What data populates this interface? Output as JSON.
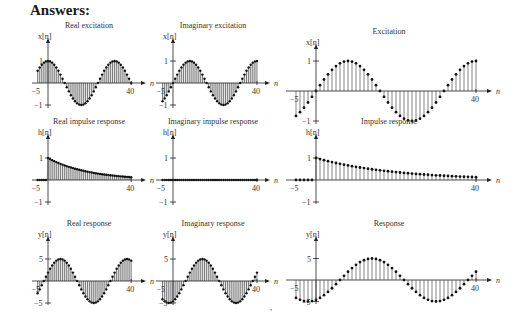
{
  "heading": "Answers:",
  "stray_mark": ",",
  "chart_data": [
    {
      "id": "real-excitation",
      "type": "stem",
      "title": "Real excitation",
      "ylabel": "x[n]",
      "xlabel": "n",
      "xticks": [
        "-5",
        "40"
      ],
      "yticks": [
        "1",
        "-1"
      ],
      "xrange": [
        -5,
        40
      ],
      "yrange": [
        -1,
        1
      ],
      "formula": "cos(2*pi*n/32)",
      "filled": true,
      "layout": {
        "x0": 48,
        "xs": 2.08,
        "y0": 83,
        "ys": 22,
        "ymax": 42,
        "ymin": 108,
        "xleft": 32,
        "xright": 142
      }
    },
    {
      "id": "imaginary-excitation",
      "type": "stem",
      "title": "Imaginary excitation",
      "ylabel": "x[n]",
      "xlabel": "n",
      "xticks": [
        "-5",
        "40"
      ],
      "yticks": [
        "1",
        "-1"
      ],
      "xrange": [
        -5,
        40
      ],
      "yrange": [
        -1,
        1
      ],
      "formula": "sin(2*pi*n/32)",
      "filled": true,
      "layout": {
        "x0": 173,
        "xs": 2.1,
        "y0": 83,
        "ys": 22,
        "ymax": 42,
        "ymin": 108,
        "xleft": 156,
        "xright": 266
      }
    },
    {
      "id": "excitation",
      "type": "stem",
      "title": "Excitation",
      "ylabel": "x[n]",
      "xlabel": "n",
      "xticks": [
        "-5",
        "40"
      ],
      "yticks": [
        "1",
        "-1"
      ],
      "xrange": [
        -5,
        40
      ],
      "yrange": [
        -1,
        1
      ],
      "formula": "sin(2*pi*n/32)",
      "filled": false,
      "layout": {
        "x0": 316,
        "xs": 4,
        "y0": 91,
        "ys": 30,
        "ymax": 48,
        "ymin": 124,
        "xleft": 286,
        "xright": 488
      }
    },
    {
      "id": "real-impulse-response",
      "type": "stem",
      "title": "Real impulse response",
      "ylabel": "h[n]",
      "xlabel": "n",
      "xticks": [
        "-5",
        "40"
      ],
      "yticks": [
        "1",
        "-1"
      ],
      "xrange": [
        -5,
        40
      ],
      "yrange": [
        -1,
        1
      ],
      "formula": "0.95^n u[n]",
      "filled": true,
      "layout": {
        "x0": 48,
        "xs": 2.08,
        "y0": 180,
        "ys": 22,
        "ymax": 138,
        "ymin": 205,
        "xleft": 32,
        "xright": 142
      }
    },
    {
      "id": "imaginary-impulse-response",
      "type": "stem",
      "title": "Imaginary impulse response",
      "ylabel": "h[n]",
      "xlabel": "n",
      "xticks": [
        "-5",
        "40"
      ],
      "yticks": [
        "1",
        "-1"
      ],
      "xrange": [
        -5,
        40
      ],
      "yrange": [
        -1,
        1
      ],
      "formula": "0",
      "filled": true,
      "layout": {
        "x0": 173,
        "xs": 2.1,
        "y0": 180,
        "ys": 22,
        "ymax": 138,
        "ymin": 205,
        "xleft": 156,
        "xright": 266
      }
    },
    {
      "id": "impulse-response",
      "type": "stem",
      "title": "Impulse response",
      "ylabel": "h[n]",
      "xlabel": "n",
      "xticks": [
        "-5",
        "40"
      ],
      "yticks": [
        "1",
        "-1"
      ],
      "xrange": [
        -5,
        40
      ],
      "yrange": [
        -1,
        1
      ],
      "formula": "0.95^n u[n]",
      "filled": false,
      "layout": {
        "x0": 316,
        "xs": 4,
        "y0": 180,
        "ys": 22,
        "ymax": 138,
        "ymin": 204,
        "xleft": 286,
        "xright": 488
      }
    },
    {
      "id": "real-response",
      "type": "stem",
      "title": "Real response",
      "ylabel": "y[n]",
      "xlabel": "n",
      "xticks": [
        "-5",
        "40"
      ],
      "yticks": [
        "5",
        "-5"
      ],
      "xrange": [
        -5,
        40
      ],
      "yrange": [
        -5,
        5
      ],
      "amplitude": 5,
      "formula": "5*sin(2*pi*(n+2)/32)",
      "filled": true,
      "layout": {
        "x0": 48,
        "xs": 2.08,
        "y0": 281,
        "ys": 4.4,
        "ymax": 240,
        "ymin": 305,
        "xleft": 32,
        "xright": 142
      }
    },
    {
      "id": "imaginary-response",
      "type": "stem",
      "title": "Imaginary response",
      "ylabel": "y[n]",
      "xlabel": "n",
      "xticks": [
        "-5",
        "40"
      ],
      "yticks": [
        "5",
        "-5"
      ],
      "xrange": [
        -5,
        40
      ],
      "yrange": [
        -5,
        5
      ],
      "amplitude": 5,
      "formula": "-5*cos(2*pi*(n+2)/32)",
      "filled": true,
      "layout": {
        "x0": 173,
        "xs": 2.1,
        "y0": 281,
        "ys": 4.4,
        "ymax": 240,
        "ymin": 305,
        "xleft": 156,
        "xright": 266
      }
    },
    {
      "id": "response",
      "type": "stem",
      "title": "Response",
      "ylabel": "y[n]",
      "xlabel": "n",
      "xticks": [
        "-5",
        "40"
      ],
      "yticks": [
        "5",
        "-5"
      ],
      "xrange": [
        -5,
        40
      ],
      "yrange": [
        -5,
        5
      ],
      "amplitude": 5,
      "formula": "-5*cos(2*pi*(n+2)/32)",
      "filled": false,
      "layout": {
        "x0": 316,
        "xs": 4,
        "y0": 280,
        "ys": 4.3,
        "ymax": 240,
        "ymin": 304,
        "xleft": 286,
        "xright": 488
      }
    }
  ]
}
